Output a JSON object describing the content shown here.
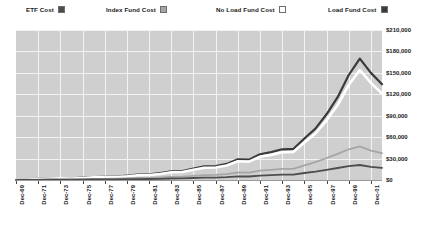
{
  "legend": {
    "items": [
      {
        "label": "ETF Cost",
        "color": "#4d4d4d",
        "swatch_name": "legend-swatch-etf-cost"
      },
      {
        "label": "Index Fund Cost",
        "color": "#a6a6a6",
        "swatch_name": "legend-swatch-index-fund-cost"
      },
      {
        "label": "No Load Fund Cost",
        "color": "#ffffff",
        "swatch_name": "legend-swatch-no-load-fund-cost"
      },
      {
        "label": "Load Fund Cost",
        "color": "#3a3a3a",
        "swatch_name": "legend-swatch-load-fund-cost"
      }
    ]
  },
  "colors": {
    "plot_background": "#cfcfcf",
    "gridline": "#f2f2f2",
    "axis": "#9a9a9a",
    "text": "#1a1a1a",
    "etf_cost": "#4d4d4d",
    "index_fund_cost": "#a6a6a6",
    "no_load_fund_cost": "#ffffff",
    "load_fund_cost": "#3a3a3a"
  },
  "chart_data": {
    "type": "line",
    "title": "",
    "subtitle": "",
    "xlabel": "",
    "ylabel": "",
    "grid": true,
    "legend_position": "top",
    "ylim": [
      0,
      210000
    ],
    "yticks": [
      0,
      30000,
      60000,
      90000,
      120000,
      150000,
      180000,
      210000
    ],
    "ytick_labels": [
      "$0",
      "$30,000",
      "$60,000",
      "$90,000",
      "$120,000",
      "$150,000",
      "$180,000",
      "$210,000"
    ],
    "x": [
      "Dec-69",
      "Dec-70",
      "Dec-71",
      "Dec-72",
      "Dec-73",
      "Dec-74",
      "Dec-75",
      "Dec-76",
      "Dec-77",
      "Dec-78",
      "Dec-79",
      "Dec-80",
      "Dec-81",
      "Dec-82",
      "Dec-83",
      "Dec-84",
      "Dec-85",
      "Dec-86",
      "Dec-87",
      "Dec-88",
      "Dec-89",
      "Dec-90",
      "Dec-91",
      "Dec-92",
      "Dec-93",
      "Dec-94",
      "Dec-95",
      "Dec-96",
      "Dec-97",
      "Dec-98",
      "Dec-99",
      "Dec-00",
      "Dec-01",
      "Dec-02"
    ],
    "xtick_labels": [
      "Dec-69",
      "Dec-71",
      "Dec-73",
      "Dec-75",
      "Dec-77",
      "Dec-79",
      "Dec-81",
      "Dec-83",
      "Dec-85",
      "Dec-87",
      "Dec-89",
      "Dec-91",
      "Dec-93",
      "Dec-95",
      "Dec-97",
      "Dec-99",
      "Dec-01"
    ],
    "xtick_indices": [
      0,
      2,
      4,
      6,
      8,
      10,
      12,
      14,
      16,
      18,
      20,
      22,
      24,
      26,
      28,
      30,
      32
    ],
    "series": [
      {
        "name": "Load Fund Cost",
        "color": "#3a3a3a",
        "values": [
          300,
          900,
          1600,
          2400,
          2600,
          2300,
          3200,
          4200,
          4400,
          4900,
          6000,
          7500,
          7800,
          9500,
          12000,
          12600,
          16000,
          19000,
          19500,
          22500,
          29000,
          28500,
          36000,
          39000,
          43000,
          43500,
          58000,
          72000,
          92000,
          116000,
          147000,
          170000,
          150000,
          134000
        ]
      },
      {
        "name": "No Load Fund Cost",
        "color": "#ffffff",
        "values": [
          250,
          800,
          1400,
          2100,
          2300,
          2000,
          2800,
          3700,
          3900,
          4300,
          5300,
          6700,
          7000,
          8500,
          10800,
          11300,
          14400,
          17200,
          17600,
          20300,
          26200,
          25700,
          32500,
          35200,
          38800,
          39300,
          52500,
          65200,
          83500,
          105000,
          133000,
          154000,
          136000,
          121000
        ]
      },
      {
        "name": "Index Fund Cost",
        "color": "#a6a6a6",
        "values": [
          120,
          350,
          620,
          900,
          980,
          870,
          1200,
          1550,
          1650,
          1800,
          2200,
          2800,
          2900,
          3500,
          4400,
          4600,
          5800,
          6900,
          7100,
          8200,
          10500,
          10300,
          13000,
          14100,
          15500,
          15700,
          20500,
          25000,
          30500,
          36500,
          43000,
          47000,
          41000,
          37500
        ]
      },
      {
        "name": "ETF Cost",
        "color": "#4d4d4d",
        "values": [
          60,
          170,
          300,
          440,
          480,
          420,
          580,
          750,
          800,
          880,
          1070,
          1350,
          1400,
          1700,
          2100,
          2200,
          2800,
          3300,
          3400,
          3900,
          5000,
          4900,
          6200,
          6700,
          7400,
          7500,
          9800,
          11800,
          14200,
          16800,
          19500,
          21000,
          18500,
          17000
        ]
      }
    ]
  }
}
